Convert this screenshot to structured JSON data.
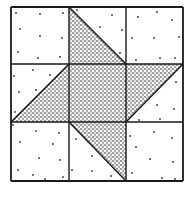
{
  "diagram": {
    "type": "quilt-block",
    "colors": {
      "background": "#ffffff",
      "line": "#1a1a1a",
      "stipple_dot": "#1a1a1a",
      "light_dot": "#333333"
    },
    "grid": {
      "x": [
        11,
        69,
        126,
        183
      ],
      "y": [
        7,
        64,
        122,
        181
      ]
    },
    "shaded_regions": [
      {
        "name": "center-square",
        "points": [
          [
            69,
            64
          ],
          [
            126,
            64
          ],
          [
            126,
            122
          ],
          [
            69,
            122
          ]
        ]
      },
      {
        "name": "top-triangle",
        "points": [
          [
            69,
            7
          ],
          [
            69,
            64
          ],
          [
            126,
            64
          ]
        ]
      },
      {
        "name": "right-triangle",
        "points": [
          [
            126,
            64
          ],
          [
            183,
            64
          ],
          [
            126,
            122
          ]
        ]
      },
      {
        "name": "bottom-triangle",
        "points": [
          [
            69,
            122
          ],
          [
            126,
            122
          ],
          [
            126,
            181
          ]
        ]
      },
      {
        "name": "left-triangle",
        "points": [
          [
            11,
            122
          ],
          [
            69,
            64
          ],
          [
            69,
            122
          ]
        ]
      }
    ],
    "light_dots": [
      [
        16,
        13
      ],
      [
        40,
        14
      ],
      [
        63,
        13
      ],
      [
        20,
        29
      ],
      [
        40,
        36
      ],
      [
        62,
        38
      ],
      [
        18,
        52
      ],
      [
        38,
        58
      ],
      [
        60,
        57
      ],
      [
        77,
        10
      ],
      [
        112,
        15
      ],
      [
        100,
        27
      ],
      [
        122,
        30
      ],
      [
        120,
        53
      ],
      [
        138,
        17
      ],
      [
        157,
        12
      ],
      [
        172,
        20
      ],
      [
        132,
        38
      ],
      [
        154,
        38
      ],
      [
        179,
        37
      ],
      [
        136,
        60
      ],
      [
        160,
        58
      ],
      [
        175,
        58
      ],
      [
        14,
        76
      ],
      [
        33,
        70
      ],
      [
        50,
        75
      ],
      [
        19,
        92
      ],
      [
        36,
        90
      ],
      [
        15,
        112
      ],
      [
        176,
        82
      ],
      [
        157,
        105
      ],
      [
        174,
        109
      ],
      [
        139,
        120
      ],
      [
        160,
        119
      ],
      [
        13,
        125
      ],
      [
        36,
        131
      ],
      [
        59,
        133
      ],
      [
        20,
        142
      ],
      [
        53,
        144
      ],
      [
        39,
        158
      ],
      [
        60,
        160
      ],
      [
        18,
        170
      ],
      [
        33,
        175
      ],
      [
        45,
        179
      ],
      [
        63,
        177
      ],
      [
        76,
        139
      ],
      [
        92,
        156
      ],
      [
        72,
        170
      ],
      [
        92,
        171
      ],
      [
        111,
        176
      ],
      [
        130,
        136
      ],
      [
        154,
        132
      ],
      [
        172,
        138
      ],
      [
        136,
        147
      ],
      [
        150,
        159
      ],
      [
        173,
        162
      ],
      [
        132,
        173
      ],
      [
        162,
        178
      ],
      [
        175,
        179
      ]
    ]
  }
}
